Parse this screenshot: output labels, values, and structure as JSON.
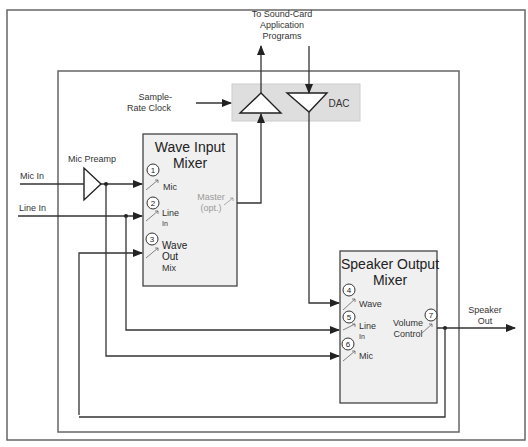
{
  "diagram": {
    "labels": {
      "to_sound_card": [
        "To Sound-Card",
        "Application",
        "Programs"
      ],
      "sample_rate_clock": [
        "Sample-",
        "Rate Clock"
      ],
      "dac": "DAC",
      "mic_preamp": "Mic Preamp",
      "mic_in": "Mic In",
      "line_in": "Line In",
      "speaker_out": [
        "Speaker",
        "Out"
      ]
    },
    "wave_input_mixer": {
      "title": [
        "Wave Input",
        "Mixer"
      ],
      "inputs": [
        {
          "num": "1",
          "label": [
            "Mic"
          ]
        },
        {
          "num": "2",
          "label": [
            "Line",
            "In"
          ]
        },
        {
          "num": "3",
          "label": [
            "Wave",
            "Out",
            "Mix"
          ]
        }
      ],
      "output": {
        "label": [
          "Master",
          "(opt.)"
        ]
      }
    },
    "speaker_output_mixer": {
      "title": [
        "Speaker Output",
        "Mixer"
      ],
      "inputs": [
        {
          "num": "4",
          "label": [
            "Wave"
          ]
        },
        {
          "num": "5",
          "label": [
            "Line",
            "In"
          ]
        },
        {
          "num": "6",
          "label": [
            "Mic"
          ]
        }
      ],
      "output": {
        "num": "7",
        "label": [
          "Volume",
          "Control"
        ]
      }
    }
  }
}
